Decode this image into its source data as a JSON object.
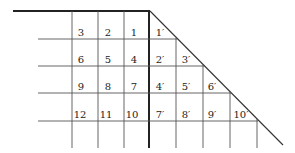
{
  "diagram": {
    "line_color": "#333333",
    "left_block": {
      "rows": [
        [
          "3",
          "2",
          "1"
        ],
        [
          "6",
          "5",
          "4"
        ],
        [
          "9",
          "8",
          "7"
        ],
        [
          "12",
          "11",
          "10"
        ]
      ]
    },
    "right_block": {
      "rows": [
        [
          "1′"
        ],
        [
          "2′",
          "3′"
        ],
        [
          "4′",
          "5′",
          "6′"
        ],
        [
          "7′",
          "8′",
          "9′",
          "10′"
        ]
      ]
    }
  }
}
